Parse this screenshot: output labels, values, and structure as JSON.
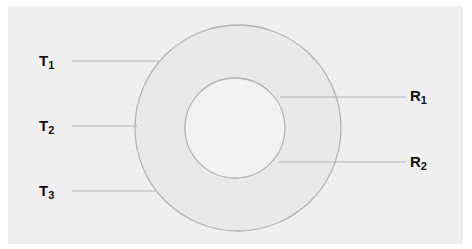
{
  "diagram": {
    "type": "concentric-circles",
    "colors": {
      "background": "#efefef",
      "ring_fill": "#e8e8e8",
      "inner_fill": "#f1f1f1",
      "stroke": "#b3b3b3",
      "label": "#111111"
    },
    "labels": {
      "T1": {
        "base": "T",
        "sub": "1"
      },
      "T2": {
        "base": "T",
        "sub": "2"
      },
      "T3": {
        "base": "T",
        "sub": "3"
      },
      "R1": {
        "base": "R",
        "sub": "1"
      },
      "R2": {
        "base": "R",
        "sub": "2"
      }
    }
  }
}
